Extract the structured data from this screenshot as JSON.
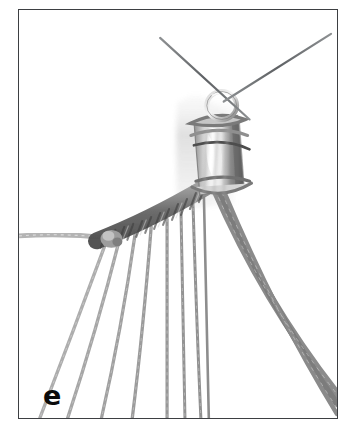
{
  "figure": {
    "step_label": "e",
    "kind": "instructional-photograph",
    "background_color": "#ffffff",
    "frame_color": "#3d3f42",
    "frame_width_px": 1.5
  },
  "palette": {
    "cord_light": "#b9b9b9",
    "cord_mid": "#9a9a9a",
    "cord_dark": "#707070",
    "knot_dark": "#6d6d6d",
    "knot_darkest": "#4e4e4e",
    "metal_light": "#f2f2f2",
    "metal_mid": "#b0b0b0",
    "metal_dark": "#5a5a5a",
    "wire": "#6b6e70",
    "blur_haze": "#dcdcdc",
    "label_color": "#0b0b0b"
  },
  "scene": {
    "wires": [
      {
        "name": "wire-left",
        "x1": 160,
        "y1": 37,
        "x2": 262,
        "y2": 124,
        "width": 2.0
      },
      {
        "name": "wire-right",
        "x1": 332,
        "y1": 33,
        "x2": 243,
        "y2": 100,
        "width": 2.0
      }
    ],
    "jump_ring": {
      "cx": 240,
      "cy": 105,
      "rx": 14,
      "ry": 13,
      "stroke": 4.5
    },
    "cone": {
      "cx": 216,
      "top_y": 118,
      "bottom_y": 190,
      "top_w": 46,
      "bottom_w": 40,
      "highlight_cx": 212,
      "highlight_cy": 155
    },
    "holding_cord": {
      "name": "horizontal-holding-cord",
      "x1": 19,
      "y1": 236,
      "x2": 108,
      "y2": 228,
      "width": 4.5
    },
    "knot_band": {
      "name": "macrame-knot-band",
      "x1": 95,
      "y1": 238,
      "x2": 205,
      "y2": 186,
      "width": 15
    },
    "left_fan_cords": [
      {
        "x1": 104,
        "y1": 243,
        "cx": 72,
        "cy": 330,
        "x2": 38,
        "y2": 419,
        "w": 3.2,
        "color": "#a9a9a9"
      },
      {
        "x1": 118,
        "y1": 239,
        "cx": 95,
        "cy": 330,
        "x2": 66,
        "y2": 419,
        "w": 3.2,
        "color": "#a3a3a3"
      },
      {
        "x1": 134,
        "y1": 232,
        "cx": 120,
        "cy": 330,
        "x2": 100,
        "y2": 419,
        "w": 3.2,
        "color": "#9e9e9e"
      },
      {
        "x1": 150,
        "y1": 226,
        "cx": 142,
        "cy": 330,
        "x2": 131,
        "y2": 419,
        "w": 3.2,
        "color": "#9a9a9a"
      },
      {
        "x1": 166,
        "y1": 218,
        "cx": 166,
        "cy": 330,
        "x2": 166,
        "y2": 419,
        "w": 3.2,
        "color": "#969696"
      },
      {
        "x1": 180,
        "y1": 210,
        "cx": 182,
        "cy": 330,
        "x2": 184,
        "y2": 419,
        "w": 3.0,
        "color": "#949494"
      },
      {
        "x1": 192,
        "y1": 200,
        "cx": 196,
        "cy": 330,
        "x2": 200,
        "y2": 419,
        "w": 3.0,
        "color": "#8f8f8f"
      },
      {
        "x1": 203,
        "y1": 192,
        "cx": 206,
        "cy": 330,
        "x2": 208,
        "y2": 419,
        "w": 2.6,
        "color": "#8c8c8c"
      }
    ],
    "right_bundle": [
      {
        "x1": 214,
        "y1": 188,
        "cx": 262,
        "cy": 300,
        "x2": 338,
        "y2": 394,
        "w": 7.5,
        "color": "#8d8d8d"
      },
      {
        "x1": 219,
        "y1": 190,
        "cx": 268,
        "cy": 305,
        "x2": 338,
        "y2": 404,
        "w": 6.0,
        "color": "#7f7f7f"
      },
      {
        "x1": 224,
        "y1": 192,
        "cx": 274,
        "cy": 312,
        "x2": 338,
        "y2": 414,
        "w": 4.5,
        "color": "#8a8a8a"
      }
    ],
    "blur_haze_box": {
      "x": 176,
      "y": 95,
      "w": 60,
      "h": 110
    }
  }
}
